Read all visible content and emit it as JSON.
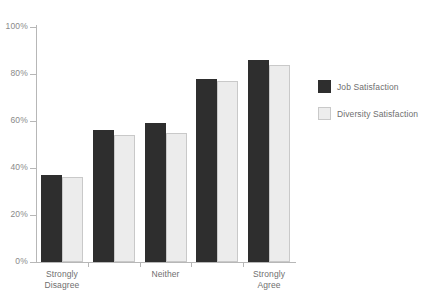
{
  "chart_data": {
    "type": "bar",
    "title": "",
    "subtitle": "",
    "xlabel": "",
    "ylabel": "",
    "categories": [
      "Strongly\nDisagree",
      "",
      "Neither",
      "",
      "Strongly\nAgree"
    ],
    "series": [
      {
        "name": "Job Satisfaction",
        "color": "#2e2e2e",
        "values": [
          37,
          56,
          59,
          78,
          86
        ]
      },
      {
        "name": "Diversity Satisfaction",
        "color": "#ececec",
        "values": [
          36,
          54,
          55,
          77,
          84
        ]
      }
    ],
    "ylim": [
      0,
      100
    ],
    "yticks": [
      0,
      20,
      40,
      60,
      80,
      100
    ],
    "ytick_labels": [
      "0%",
      "20%",
      "40%",
      "60%",
      "80%",
      "100%"
    ],
    "grid": false,
    "legend_position": "right"
  },
  "legend": {
    "items": [
      {
        "label": "Job Satisfaction",
        "swatch": "dark"
      },
      {
        "label": "Diversity Satisfaction",
        "swatch": "light"
      }
    ]
  },
  "axis": {
    "y_labels": [
      "100%",
      "80%",
      "60%",
      "40%",
      "20%",
      "0%"
    ],
    "x_labels": [
      "Strongly\nDisagree",
      "Neither",
      "Strongly\nAgree"
    ]
  }
}
